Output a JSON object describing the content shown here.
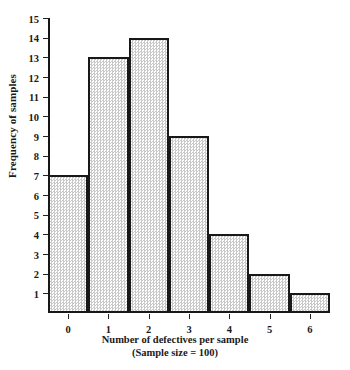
{
  "chart_data": {
    "type": "bar",
    "title": "",
    "subtitle": "",
    "xlabel": "Number of defectives per sample",
    "xlabel_note": "(Sample size = 100)",
    "ylabel": "Frequency of samples",
    "categories": [
      "0",
      "1",
      "2",
      "3",
      "4",
      "5",
      "6"
    ],
    "values": [
      7,
      13,
      14,
      9,
      4,
      2,
      1
    ],
    "yticks": [
      1,
      2,
      3,
      4,
      5,
      6,
      7,
      8,
      9,
      10,
      11,
      12,
      13,
      14,
      15
    ],
    "ytick_labels": [
      "1",
      "2",
      "3",
      "4",
      "5",
      "6",
      "7",
      "8",
      "9",
      "10",
      "11",
      "12",
      "13",
      "14",
      "15"
    ],
    "xtick_labels": [
      "0",
      "1",
      "2",
      "3",
      "4",
      "5",
      "6"
    ],
    "ylim": [
      0,
      15
    ],
    "xlim": [
      -0.5,
      6.5
    ],
    "grid": false,
    "legend": false,
    "legend_position": "none",
    "annotations": [],
    "colors": {
      "bar_outline": "#181818",
      "bar_fill_dot": "#c9c9c9",
      "bar_fill_base": "#fdfdfd",
      "axis": "#151515",
      "text": "#1a1a1a",
      "background": "#ffffff"
    }
  }
}
